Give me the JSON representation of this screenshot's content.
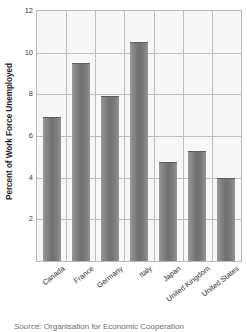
{
  "chart_data": {
    "type": "bar",
    "title": "",
    "xlabel": "",
    "ylabel": "Percent of Work Force Unemployed",
    "ylim": [
      0,
      12
    ],
    "ytick_step": 2,
    "yticks": [
      2,
      4,
      6,
      8,
      10,
      12
    ],
    "grid": true,
    "legend": "none",
    "categories": [
      "Canada",
      "France",
      "Germany",
      "Italy",
      "Japan",
      "United Kingdom",
      "United States"
    ],
    "values": [
      6.9,
      9.5,
      7.9,
      10.5,
      4.75,
      5.3,
      4.0
    ],
    "series": [
      {
        "name": "Percent of Work Force Unemployed",
        "values": [
          6.9,
          9.5,
          7.9,
          10.5,
          4.75,
          5.3,
          4.0
        ]
      }
    ]
  },
  "style": {
    "bar_color": "#7a7a7a",
    "plot_background": "#f7f7f7",
    "grid_color": "#bdbdbd",
    "axis_color": "#b9b9b9",
    "text_color": "#2b2b2b"
  },
  "source": {
    "label": "Source:",
    "text": "Organisation for Economic Cooperation"
  }
}
